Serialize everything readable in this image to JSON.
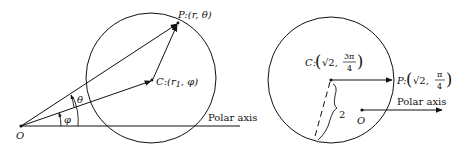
{
  "figure_left": {
    "origin_label": "O",
    "axis_label": "Polar axis",
    "point_P_label": "P:(r, θ)",
    "point_C_label": "C:(r",
    "point_C_sub": "1",
    "point_C_tail": ", φ)",
    "angle_theta": "θ",
    "angle_phi": "φ"
  },
  "figure_right": {
    "origin_label": "O",
    "axis_label": "Polar axis",
    "point_C_prefix": "C:",
    "point_C_r": "√2,",
    "point_C_num": "3π",
    "point_C_den": "4",
    "point_P_prefix": "P:",
    "point_P_r": "√2,",
    "point_P_num": "π",
    "point_P_den": "4",
    "radius_label": "2"
  },
  "colors": {
    "ink": "#111111",
    "background": "#ffffff"
  }
}
